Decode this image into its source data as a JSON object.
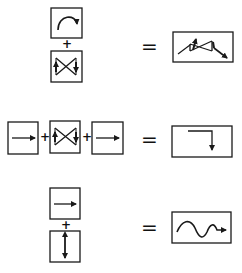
{
  "diagram": {
    "colors": {
      "stroke": "#1a1a1a",
      "background": "#ffffff"
    },
    "operators": {
      "plus": "+",
      "equals": "="
    },
    "rows": [
      {
        "inputs": [
          "curved-arrow-icon",
          "bowtie-arrows-icon"
        ],
        "layout": "vertical",
        "result": "tilted-bowtie-with-diagonal-arrow-icon"
      },
      {
        "inputs": [
          "right-arrow-icon",
          "bowtie-arrows-icon",
          "right-arrow-icon"
        ],
        "layout": "horizontal",
        "result": "right-then-down-arrow-icon"
      },
      {
        "inputs": [
          "right-arrow-icon",
          "vertical-double-arrow-icon"
        ],
        "layout": "vertical",
        "result": "wave-arrow-icon"
      }
    ]
  }
}
